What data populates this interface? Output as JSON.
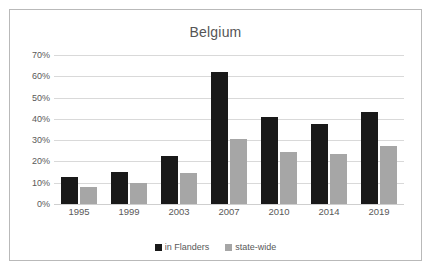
{
  "chart_data": {
    "type": "bar",
    "title": "Belgium",
    "xlabel": "",
    "ylabel": "",
    "categories": [
      "1995",
      "1999",
      "2003",
      "2007",
      "2010",
      "2014",
      "2019"
    ],
    "series": [
      {
        "name": "in Flanders",
        "color": "#191919",
        "values": [
          12.8,
          15.0,
          22.5,
          61.8,
          40.7,
          37.5,
          43.2
        ]
      },
      {
        "name": "state-wide",
        "color": "#a6a6a6",
        "values": [
          8.0,
          9.9,
          14.8,
          30.6,
          24.4,
          23.3,
          27.3
        ]
      }
    ],
    "ylim": [
      0,
      70
    ],
    "ytick_labels": [
      "0%",
      "10%",
      "20%",
      "30%",
      "40%",
      "50%",
      "60%",
      "70%"
    ],
    "ytick_values": [
      0,
      10,
      20,
      30,
      40,
      50,
      60,
      70
    ],
    "grid": true,
    "legend_position": "bottom",
    "value_suffix": "%"
  },
  "frame": {
    "border_color": "#b9b9b9",
    "background": "#ffffff"
  }
}
